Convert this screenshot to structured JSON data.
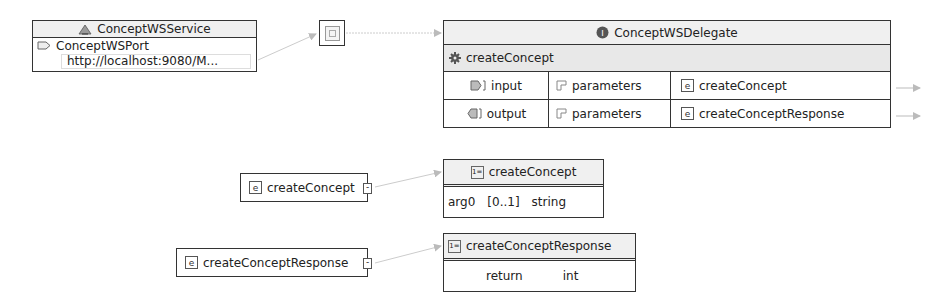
{
  "service": {
    "title": "ConceptWSService",
    "port": "ConceptWSPort",
    "address": "http://localhost:9080/M..."
  },
  "binding": {
    "icon": "binding-icon"
  },
  "port_type": {
    "title": "ConceptWSDelegate",
    "operation": "createConcept",
    "rows": [
      {
        "direction": "input",
        "part": "parameters",
        "element": "createConcept"
      },
      {
        "direction": "output",
        "part": "parameters",
        "element": "createConceptResponse"
      }
    ]
  },
  "elements": [
    {
      "name": "createConcept",
      "type_name": "createConcept",
      "fields": [
        {
          "name": "arg0",
          "cardinality": "[0..1]",
          "type": "string"
        }
      ]
    },
    {
      "name": "createConceptResponse",
      "type_name": "createConceptResponse",
      "fields": [
        {
          "name": "return",
          "cardinality": "",
          "type": "int"
        }
      ]
    }
  ],
  "colors": {
    "border": "#333333",
    "header_bg": "#f0f0f0",
    "connector": "#bbbbbb"
  }
}
